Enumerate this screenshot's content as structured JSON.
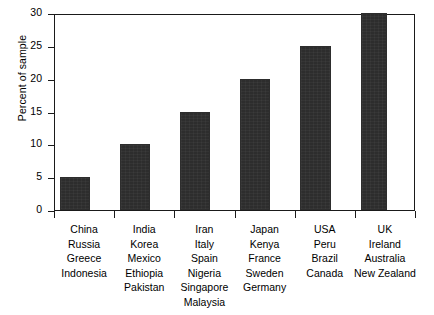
{
  "chart_data": {
    "type": "bar",
    "title": "",
    "xlabel": "",
    "ylabel": "Percent of sample",
    "ylim": [
      0,
      30
    ],
    "yticks": [
      0,
      5,
      10,
      15,
      20,
      25,
      30
    ],
    "grid": false,
    "legend": null,
    "bar_color": "#2d2d2d",
    "axis_color": "#1a1a1a",
    "categories": [
      "China Russia Greece Indonesia",
      "India Korea Mexico Ethiopia Pakistan",
      "Iran Italy Spain Nigeria Singapore Malaysia",
      "Japan Kenya France Sweden Germany",
      "USA Peru Brazil Canada",
      "UK Ireland Australia New Zealand"
    ],
    "category_lines": [
      [
        "China",
        "Russia",
        "Greece",
        "Indonesia"
      ],
      [
        "India",
        "Korea",
        "Mexico",
        "Ethiopia",
        "Pakistan"
      ],
      [
        "Iran",
        "Italy",
        "Spain",
        "Nigeria",
        "Singapore",
        "Malaysia"
      ],
      [
        "Japan",
        "Kenya",
        "France",
        "Sweden",
        "Germany"
      ],
      [
        "USA",
        "Peru",
        "Brazil",
        "Canada"
      ],
      [
        "UK",
        "Ireland",
        "Australia",
        "New Zealand"
      ]
    ],
    "values": [
      5,
      10,
      15,
      20,
      25,
      30
    ]
  }
}
